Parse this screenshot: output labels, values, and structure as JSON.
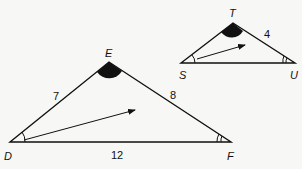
{
  "diagram": {
    "type": "similar-triangles",
    "large_triangle": {
      "vertices": {
        "D": "D",
        "E": "E",
        "F": "F"
      },
      "sides": {
        "DE": "7",
        "EF": "8",
        "DF": "12"
      },
      "angle_marks": {
        "E": "filled-arc",
        "D": "single-arc",
        "F": "double-arc"
      },
      "arrow": "rotation-arrow"
    },
    "small_triangle": {
      "vertices": {
        "S": "S",
        "T": "T",
        "U": "U"
      },
      "sides": {
        "TU": "4"
      },
      "angle_marks": {
        "T": "filled-arc",
        "S": "single-arc",
        "U": "double-arc"
      },
      "arrow": "rotation-arrow"
    },
    "colors": {
      "stroke": "#111111",
      "background": "#f7f7f5"
    }
  }
}
